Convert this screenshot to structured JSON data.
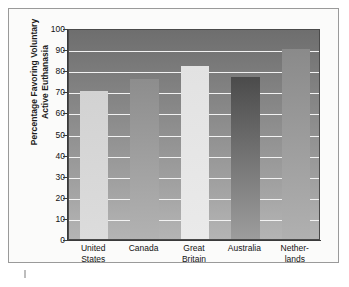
{
  "chart_data": {
    "type": "bar",
    "title": "",
    "subtitle": "",
    "xlabel": "",
    "ylabel": "Percentage Favoring Voluntary Active Euthanasia",
    "ylabel_lines": [
      "Percentage Favoring Voluntary",
      "Active Euthanasia"
    ],
    "categories": [
      "United States",
      "Canada",
      "Great Britain",
      "Australia",
      "Netherlands"
    ],
    "category_label_lines": [
      [
        "United",
        "States"
      ],
      [
        "Canada",
        ""
      ],
      [
        "Great",
        "Britain"
      ],
      [
        "Australia",
        ""
      ],
      [
        "Nether-",
        "lands"
      ]
    ],
    "values": [
      70,
      76,
      82,
      77,
      90
    ],
    "ylim": [
      0,
      100
    ],
    "ytick_values": [
      0,
      10,
      20,
      30,
      40,
      50,
      60,
      70,
      80,
      90,
      100
    ],
    "ytick_labels": [
      "0",
      "10",
      "20",
      "30",
      "40",
      "50",
      "60",
      "70",
      "80",
      "90",
      "100"
    ],
    "grid": true,
    "grid_color": "#f2f2f2",
    "legend": false,
    "legend_position": "none",
    "bar_colors": [
      "#d2d2d2",
      "#8d8d8d",
      "#e2e2e2",
      "#4b4b4b",
      "#8a8a8a"
    ],
    "bar_colors_bottom": [
      "#dcdcdc",
      "#b2b2b2",
      "#eaeaea",
      "#9d9d9d",
      "#b0b0b0"
    ],
    "plot_background_top": "#6e6e6e",
    "plot_background_bottom": "#b4b4b4",
    "axis_color": "#3a3a3a",
    "page_background": "#fbfbfa",
    "frame_color": "#9a9a9a"
  }
}
